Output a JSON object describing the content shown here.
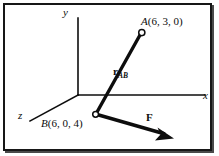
{
  "figure": {
    "type": "vector-diagram",
    "background_color": "#ffffff",
    "ink_color": "#0d0d0d",
    "frame": {
      "border_color": "#171717",
      "shadow_color": "#4a4a4a"
    },
    "axes": [
      {
        "name": "y-axis",
        "label": "y",
        "from": [
          78,
          95
        ],
        "to": [
          78,
          18
        ]
      },
      {
        "name": "x-axis",
        "label": "x",
        "from": [
          78,
          95
        ],
        "to": [
          205,
          95
        ]
      },
      {
        "name": "z-axis",
        "label": "z",
        "from": [
          78,
          95
        ],
        "to": [
          30,
          121
        ]
      }
    ],
    "points": [
      {
        "name": "point-a",
        "label": "A",
        "coordinates": "(6, 3, 0)",
        "label_text": "A (6, 3, 0)",
        "marker": "open-circle",
        "position": [
          141,
          33
        ]
      },
      {
        "name": "point-b",
        "label": "B",
        "coordinates": "(6, 0, 4)",
        "label_text": "B (6, 0, 4)",
        "marker": "open-circle",
        "position": [
          96,
          114
        ]
      }
    ],
    "vectors": [
      {
        "name": "position-vector-ab",
        "label": "r",
        "subscript": "AB",
        "from": [
          141,
          33
        ],
        "to": [
          96,
          114
        ],
        "style": "thick-line-no-arrowhead"
      },
      {
        "name": "force-vector",
        "label": "F",
        "subscript": "",
        "from": [
          96,
          114
        ],
        "to": [
          172,
          137
        ],
        "style": "thick-line-with-arrowhead"
      }
    ]
  }
}
